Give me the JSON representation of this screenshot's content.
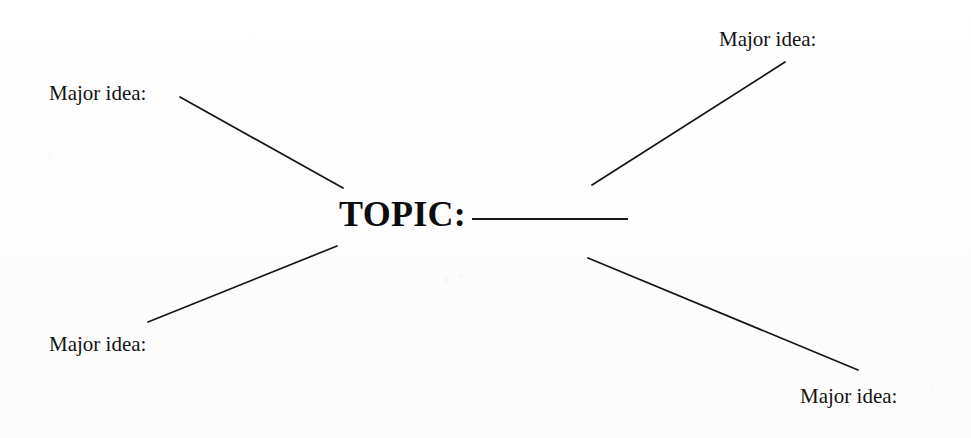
{
  "document": {
    "type": "mind-map-worksheet",
    "background_color": "#fefefe",
    "ink_color": "#121212"
  },
  "center": {
    "topic_label": "TOPIC:",
    "blank_line_name": "topic-fill-in-blank"
  },
  "branches": [
    {
      "id": "top-left",
      "label": "Major idea:",
      "connector": {
        "x1": 180,
        "y1": 97,
        "x2": 343,
        "y2": 188
      }
    },
    {
      "id": "top-right",
      "label": "Major idea:",
      "connector": {
        "x1": 592,
        "y1": 185,
        "x2": 785,
        "y2": 62
      }
    },
    {
      "id": "bottom-left",
      "label": "Major idea:",
      "connector": {
        "x1": 148,
        "y1": 322,
        "x2": 337,
        "y2": 246
      }
    },
    {
      "id": "bottom-right",
      "label": "Major idea:",
      "connector": {
        "x1": 588,
        "y1": 258,
        "x2": 858,
        "y2": 370
      }
    }
  ]
}
